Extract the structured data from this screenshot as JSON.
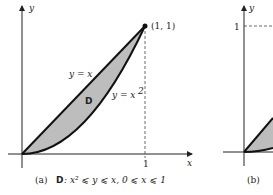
{
  "panel_a": {
    "axis_x_label": "x",
    "axis_y_label": "y",
    "point_label": "(1, 1)",
    "x_tick_label": "1",
    "curve_upper_label": "y = x",
    "curve_lower_label": "y = x",
    "curve_lower_exponent": "2",
    "region_label": "D",
    "caption_prefix": "(a)",
    "caption_region": "D",
    "caption_text": ": x² ⩽ y ⩽ x,  0 ⩽ x ⩽ 1",
    "fill_color": "#bdbdbd"
  },
  "panel_b": {
    "axis_y_label": "y",
    "y_tick_label": "1",
    "caption_prefix": "(b)"
  }
}
